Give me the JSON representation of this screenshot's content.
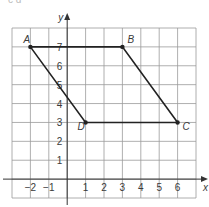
{
  "diagram": {
    "type": "coordinate-grid-quadrilateral",
    "grid": {
      "x_min": -3,
      "x_max": 7,
      "y_min": -1,
      "y_max": 8,
      "line_color": "#9a9a9a",
      "axis_color": "#333333",
      "shape_color": "#222222"
    },
    "axes": {
      "x_label": "x",
      "y_label": "y",
      "x_ticks": [
        "−2",
        "−1",
        "1",
        "2",
        "3",
        "4",
        "5",
        "6"
      ],
      "y_ticks": [
        "1",
        "2",
        "3",
        "4",
        "5",
        "6",
        "7"
      ]
    },
    "points": [
      {
        "name": "A",
        "x": -2,
        "y": 7
      },
      {
        "name": "B",
        "x": 3,
        "y": 7
      },
      {
        "name": "C",
        "x": 6,
        "y": 3
      },
      {
        "name": "D",
        "x": 1,
        "y": 3
      }
    ],
    "polygon_order": [
      "A",
      "B",
      "C",
      "D"
    ],
    "top_cutoff_text": "c d"
  }
}
